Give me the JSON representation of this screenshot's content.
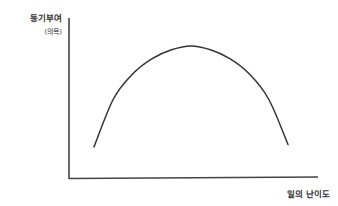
{
  "chart_data": {
    "type": "line",
    "title": "",
    "ylabel": "동기부여",
    "ylabel_sub": "(의욕)",
    "xlabel": "일의 난이도",
    "grid": false,
    "legend": null,
    "x": [
      0.0,
      0.1,
      0.2,
      0.3,
      0.4,
      0.5,
      0.6,
      0.7,
      0.8,
      0.9,
      1.0
    ],
    "series": [
      {
        "name": "motivation",
        "values": [
          0.2,
          0.58,
          0.78,
          0.9,
          0.97,
          1.0,
          0.97,
          0.9,
          0.78,
          0.58,
          0.22
        ]
      }
    ],
    "xlim": [
      0,
      1
    ],
    "ylim": [
      0,
      1
    ]
  },
  "colors": {
    "axis": "#444444",
    "curve": "#333333",
    "text": "#333333"
  }
}
